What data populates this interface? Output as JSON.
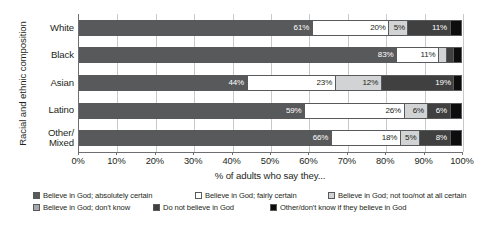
{
  "chart_data": {
    "type": "bar",
    "orientation": "horizontal",
    "stacked": true,
    "stack_mode": "percent",
    "title": "",
    "xlabel": "% of adults who say they...",
    "ylabel": "Racial and ethnic composition",
    "xlim": [
      0,
      100
    ],
    "xticks": [
      "0%",
      "10%",
      "20%",
      "30%",
      "40%",
      "50%",
      "60%",
      "70%",
      "80%",
      "90%",
      "100%"
    ],
    "grid": true,
    "legend_position": "bottom",
    "categories": [
      "White",
      "Black",
      "Asian",
      "Latino",
      "Other/\nMixed"
    ],
    "series": [
      {
        "name": "Believe in God; absolutely certain",
        "color": "#58595b",
        "label_color": "light",
        "values": [
          61,
          83,
          44,
          59,
          66
        ],
        "labels": [
          "61%",
          "83%",
          "44%",
          "59%",
          "66%"
        ]
      },
      {
        "name": "Believe in God; fairly certain",
        "color": "#ffffff",
        "label_color": "dark",
        "values": [
          20,
          11,
          23,
          26,
          18
        ],
        "labels": [
          "20%",
          "11%",
          "23%",
          "26%",
          "18%"
        ]
      },
      {
        "name": "Believe in God; not too/not at all certain",
        "color": "#d1d3d4",
        "label_color": "dark",
        "values": [
          5,
          2,
          12,
          6,
          5
        ],
        "labels": [
          "5%",
          "",
          "12%",
          "6%",
          "5%"
        ]
      },
      {
        "name": "Believe in God; don't know",
        "color": "#404041",
        "label_color": "light",
        "values": [
          11,
          2,
          19,
          6,
          8
        ],
        "labels": [
          "11%",
          "",
          "19%",
          "6%",
          "8%"
        ]
      },
      {
        "name": "Do not believe in God",
        "color": "#0d0d0d",
        "label_color": "light",
        "values": [
          3,
          2,
          2,
          3,
          3
        ],
        "labels": [
          "",
          "",
          "",
          "",
          ""
        ]
      }
    ],
    "legend_entries": [
      {
        "label": "Believe in God; absolutely certain",
        "color": "#58595b"
      },
      {
        "label": "Believe in God; fairly certain",
        "color": "#ffffff"
      },
      {
        "label": "Believe in God; not too/not at all certain",
        "color": "#d1d3d4"
      },
      {
        "label": "Believe in God; don't know",
        "color": "#a7a9ac"
      },
      {
        "label": "Do not believe in God",
        "color": "#404041"
      },
      {
        "label": "Other/don't know if they believe in God",
        "color": "#0d0d0d"
      }
    ]
  }
}
